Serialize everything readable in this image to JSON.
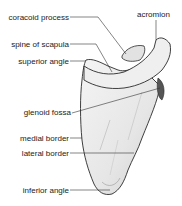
{
  "diagram": {
    "labels": {
      "coracoid_process": "coracoid process",
      "spine_of_scapula": "spine of scapula",
      "superior_angle": "superior angle",
      "acromion": "acromion",
      "glenoid_fossa": "glenoid fossa",
      "medial_border": "medial border",
      "lateral_border": "lateral border",
      "inferior_angle": "inferior angle"
    },
    "colors": {
      "text": "#222222",
      "leader_line": "#333333",
      "bone_fill": "#ececec",
      "bone_shadow": "#c8c8c8",
      "outline": "#2a2a2a"
    }
  }
}
